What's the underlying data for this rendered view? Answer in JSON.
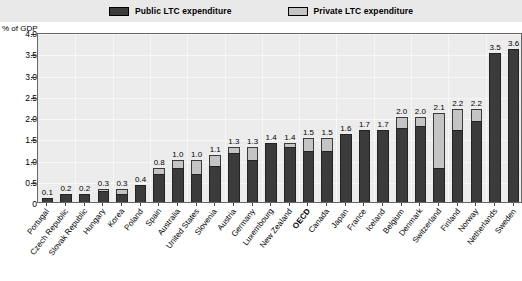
{
  "legend": {
    "items": [
      {
        "label": "Public LTC expenditure",
        "color": "#3b3b3b",
        "icon": "square-swatch-icon"
      },
      {
        "label": "Private LTC expenditure",
        "color": "#c4c4c4",
        "icon": "square-swatch-icon"
      }
    ]
  },
  "axis": {
    "y_title": "% of GDP",
    "y_ticks": [
      "0",
      "0.5",
      "1.0",
      "1.5",
      "2.0",
      "2.5",
      "3.0",
      "3.5",
      "4.0"
    ]
  },
  "chart_data": {
    "type": "bar",
    "title": "",
    "subtitle": "",
    "xlabel": "",
    "ylabel": "% of GDP",
    "ylim": [
      0,
      4.0
    ],
    "ytick_step": 0.5,
    "grid": true,
    "stacked": true,
    "legend_position": "top",
    "legend": [
      "Public LTC expenditure",
      "Private LTC expenditure"
    ],
    "categories": [
      "Portugal",
      "Czech Republic",
      "Slovak Republic",
      "Hungary",
      "Korea",
      "Poland",
      "Spain",
      "Australia",
      "United States",
      "Slovenia",
      "Austria",
      "Germany",
      "Luxembourg",
      "New Zealand",
      "OECD",
      "Canada",
      "Japan",
      "France",
      "Iceland",
      "Belgium",
      "Denmark",
      "Switzerland",
      "Finland",
      "Norway",
      "Netherlands",
      "Sweden"
    ],
    "highlight_category": "OECD",
    "series": [
      {
        "name": "Public LTC expenditure",
        "values": [
          0.1,
          0.2,
          0.2,
          0.25,
          0.2,
          0.4,
          0.65,
          0.8,
          0.65,
          0.85,
          1.15,
          1.0,
          1.4,
          1.3,
          1.2,
          1.2,
          1.6,
          1.7,
          1.7,
          1.75,
          1.8,
          0.8,
          1.7,
          1.9,
          3.5,
          3.6
        ]
      },
      {
        "name": "Private LTC expenditure",
        "values": [
          0.0,
          0.0,
          0.0,
          0.05,
          0.1,
          0.0,
          0.15,
          0.2,
          0.35,
          0.25,
          0.15,
          0.3,
          0.0,
          0.1,
          0.3,
          0.3,
          0.0,
          0.0,
          0.0,
          0.25,
          0.2,
          1.3,
          0.5,
          0.3,
          0.0,
          0.0
        ]
      }
    ],
    "totals": [
      0.1,
      0.2,
      0.2,
      0.3,
      0.3,
      0.4,
      0.8,
      1.0,
      1.0,
      1.1,
      1.3,
      1.3,
      1.4,
      1.4,
      1.5,
      1.5,
      1.6,
      1.7,
      1.7,
      2.0,
      2.0,
      2.1,
      2.2,
      2.2,
      3.5,
      3.6
    ],
    "value_labels": [
      "0.1",
      "0.2",
      "0.2",
      "0.3",
      "0.3",
      "0.4",
      "0.8",
      "1.0",
      "1.0",
      "1.1",
      "1.3",
      "1.3",
      "1.4",
      "1.4",
      "1.5",
      "1.5",
      "1.6",
      "1.7",
      "1.7",
      "2.0",
      "2.0",
      "2.1",
      "2.2",
      "2.2",
      "3.5",
      "3.6"
    ],
    "colors": {
      "public": "#3b3b3b",
      "private": "#c4c4c4",
      "plot_bg": "#ececec"
    }
  }
}
